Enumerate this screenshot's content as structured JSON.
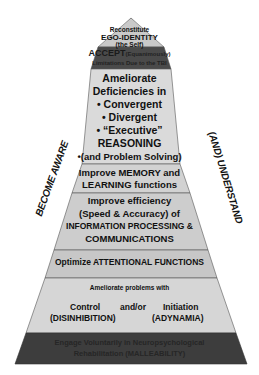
{
  "colors": {
    "tier_light": "#d4d4d4",
    "tier_mid": "#c8c8c8",
    "tier_dark": "#3f3f3f",
    "tier_accept": "#4a4a4a",
    "border": "#555555",
    "text": "#111111"
  },
  "side_labels": {
    "left": "BECOME AWARE",
    "right": "(AND) UNDERSTAND"
  },
  "tiers": [
    {
      "id": "ego",
      "lines": [
        "Reconstitute",
        "EGO-IDENTITY",
        "(the Self)"
      ]
    },
    {
      "id": "accept",
      "line1_bold": "ACCEPT",
      "line1_rest": "(Equanimously)",
      "line2": "Limitations Due to the TBI"
    },
    {
      "id": "reasoning",
      "lines": [
        "Ameliorate",
        "Deficiencies in",
        "• Convergent",
        "• Divergent",
        "• “Executive”",
        "REASONING",
        "•(and Problem Solving)"
      ]
    },
    {
      "id": "memory",
      "lines": [
        "Improve MEMORY and",
        "LEARNING functions"
      ]
    },
    {
      "id": "processing",
      "lines": [
        "Improve efficiency",
        "(Speed & Accuracy) of",
        "INFORMATION PROCESSING &",
        "COMMUNICATIONS"
      ]
    },
    {
      "id": "attention",
      "lines": [
        "Optimize ATTENTIONAL FUNCTIONS"
      ]
    },
    {
      "id": "control",
      "header": "Ameliorate problems with",
      "left_top": "Control",
      "mid": "and/or",
      "right_top": "Initiation",
      "left_bottom": "(DISINHIBITION)",
      "right_bottom": "(ADYNAMIA)"
    },
    {
      "id": "engage",
      "lines": [
        "Engage Voluntarily in Neuropsychological",
        "Rehabilitation (MALLEABILITY)"
      ]
    }
  ]
}
